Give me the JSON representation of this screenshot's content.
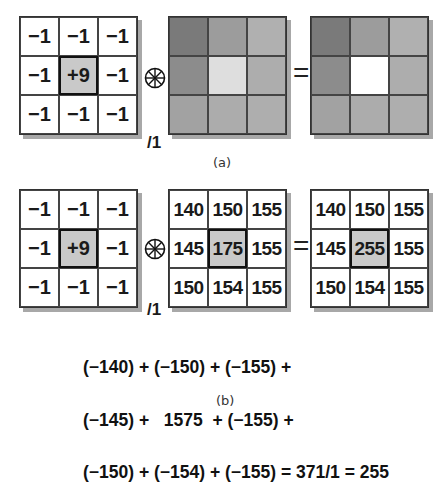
{
  "panel_a": {
    "caption": "(a)",
    "kernel": {
      "cells": [
        "−1",
        "−1",
        "−1",
        "−1",
        "+9",
        "−1",
        "−1",
        "−1",
        "−1"
      ],
      "center_bg": "#c9c9c9",
      "divisor": "/1"
    },
    "operator": "convolution",
    "input_image": {
      "colors": [
        "#7a7a7a",
        "#9c9c9c",
        "#b0b0b0",
        "#8c8c8c",
        "#dedede",
        "#adadad",
        "#a2a2a2",
        "#acacac",
        "#aeaeae"
      ]
    },
    "equals": "=",
    "output_image": {
      "colors": [
        "#7a7a7a",
        "#9c9c9c",
        "#b0b0b0",
        "#8c8c8c",
        "#ffffff",
        "#adadad",
        "#a2a2a2",
        "#acacac",
        "#aeaeae"
      ]
    }
  },
  "panel_b": {
    "caption": "(b)",
    "kernel": {
      "cells": [
        "−1",
        "−1",
        "−1",
        "−1",
        "+9",
        "−1",
        "−1",
        "−1",
        "−1"
      ],
      "center_bg": "#c9c9c9",
      "divisor": "/1"
    },
    "operator": "convolution",
    "input_values": {
      "cells": [
        "140",
        "150",
        "155",
        "145",
        "175",
        "155",
        "150",
        "154",
        "155"
      ]
    },
    "equals": "=",
    "output_values": {
      "cells": [
        "140",
        "150",
        "155",
        "145",
        "255",
        "155",
        "150",
        "154",
        "155"
      ]
    },
    "formula": {
      "line1": "(−140) + (−150) + (−155) +",
      "line2": "(−145) +   1575  + (−155) +",
      "line3": "(−150) + (−154) + (−155) = 371/1 = 255"
    }
  }
}
